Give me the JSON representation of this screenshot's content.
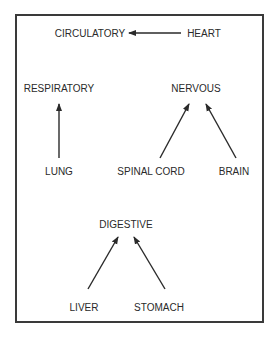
{
  "diagram": {
    "nodes": {
      "circulatory": {
        "label": "CIRCULATORY",
        "x": 90,
        "y": 28
      },
      "heart": {
        "label": "HEART",
        "x": 204,
        "y": 28
      },
      "respiratory": {
        "label": "RESPIRATORY",
        "x": 59,
        "y": 83
      },
      "nervous": {
        "label": "NERVOUS",
        "x": 196,
        "y": 83
      },
      "lung": {
        "label": "LUNG",
        "x": 59,
        "y": 166
      },
      "spinal_cord": {
        "label": "SPINAL CORD",
        "x": 151,
        "y": 166
      },
      "brain": {
        "label": "BRAIN",
        "x": 234,
        "y": 166
      },
      "digestive": {
        "label": "DIGESTIVE",
        "x": 126,
        "y": 219
      },
      "liver": {
        "label": "LIVER",
        "x": 84,
        "y": 302
      },
      "stomach": {
        "label": "STOMACH",
        "x": 159,
        "y": 302
      }
    },
    "edges": [
      {
        "from": "HEART",
        "to": "CIRCULATORY",
        "x1": 181,
        "y1": 33,
        "x2": 129,
        "y2": 33
      },
      {
        "from": "LUNG",
        "to": "RESPIRATORY",
        "x1": 59,
        "y1": 158,
        "x2": 59,
        "y2": 104
      },
      {
        "from": "SPINAL CORD",
        "to": "NERVOUS",
        "x1": 160,
        "y1": 158,
        "x2": 189,
        "y2": 104
      },
      {
        "from": "BRAIN",
        "to": "NERVOUS",
        "x1": 236,
        "y1": 158,
        "x2": 206,
        "y2": 104
      },
      {
        "from": "LIVER",
        "to": "DIGESTIVE",
        "x1": 88,
        "y1": 289,
        "x2": 118,
        "y2": 237
      },
      {
        "from": "STOMACH",
        "to": "DIGESTIVE",
        "x1": 165,
        "y1": 289,
        "x2": 134,
        "y2": 237
      }
    ],
    "colors": {
      "line": "#2a2a2a",
      "border": "#3a3a3a",
      "background": "#ffffff"
    }
  }
}
